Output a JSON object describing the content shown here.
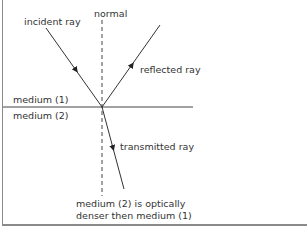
{
  "diagram": {
    "labels": {
      "normal": "normal",
      "incident": "incident ray",
      "reflected": "reflected ray",
      "transmitted": "transmitted ray",
      "medium1": "medium (1)",
      "medium2": "medium (2)",
      "note_line1": "medium (2) is optically",
      "note_line2": "denser then medium (1)"
    },
    "colors": {
      "line": "#3a3a3a",
      "frame": "#8a8a8a",
      "text": "#333333"
    }
  }
}
